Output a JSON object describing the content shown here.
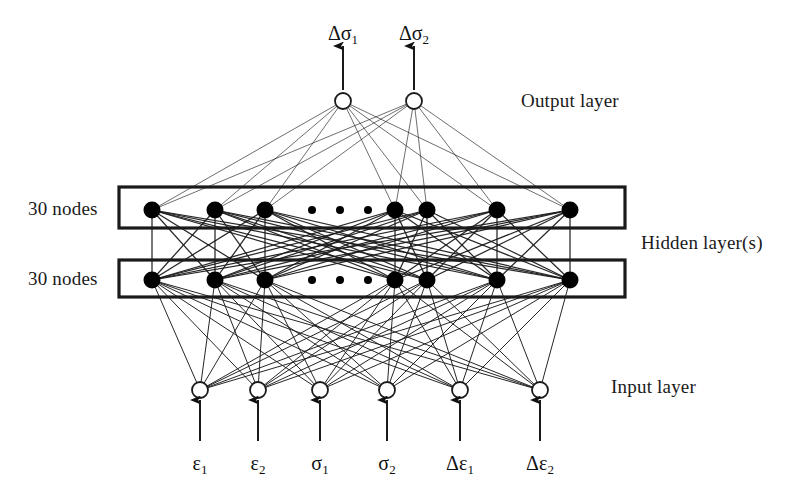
{
  "figure": {
    "type": "neural-network-architecture-diagram",
    "background_color": "#ffffff",
    "line_color": "#1a1a1a",
    "node_fill_hidden": "#000000",
    "node_fill_io": "#ffffff"
  },
  "labels": {
    "output_layer": "Output layer",
    "hidden_layers": "Hidden layer(s)",
    "input_layer": "Input layer",
    "hidden_count_top": "30 nodes",
    "hidden_count_bottom": "30 nodes"
  },
  "outputs": {
    "count": 2,
    "items": [
      {
        "symbol": "Δσ",
        "subscript": "1",
        "x": 343
      },
      {
        "symbol": "Δσ",
        "subscript": "2",
        "x": 414
      }
    ],
    "node_y": 101,
    "label_y": 22,
    "arrow_top_y": 46,
    "arrow_bottom_y": 90
  },
  "inputs": {
    "count": 6,
    "items": [
      {
        "symbol": "ε",
        "subscript": "1",
        "x": 200
      },
      {
        "symbol": "ε",
        "subscript": "2",
        "x": 258
      },
      {
        "symbol": "σ",
        "subscript": "1",
        "x": 320
      },
      {
        "symbol": "σ",
        "subscript": "2",
        "x": 387
      },
      {
        "symbol": "Δε",
        "subscript": "1",
        "x": 460
      },
      {
        "symbol": "Δε",
        "subscript": "2",
        "x": 540
      }
    ],
    "node_y": 390,
    "arrow_top_y": 400,
    "arrow_bottom_y": 441,
    "label_y": 452
  },
  "hidden_layers": [
    {
      "name": "hidden-layer-top",
      "nodes_label": "30 nodes",
      "box": {
        "x": 119,
        "y": 187,
        "width": 506,
        "height": 41
      },
      "node_y": 210,
      "node_x": [
        152,
        215,
        265,
        395,
        427,
        497,
        570
      ],
      "ellipsis_x": [
        312,
        340,
        368
      ]
    },
    {
      "name": "hidden-layer-bottom",
      "nodes_label": "30 nodes",
      "box": {
        "x": 119,
        "y": 260,
        "width": 506,
        "height": 37
      },
      "node_y": 280,
      "node_x": [
        152,
        215,
        265,
        395,
        427,
        497,
        570
      ],
      "ellipsis_x": [
        312,
        340,
        368
      ]
    }
  ],
  "side_labels": {
    "output_layer": {
      "x": 521,
      "y": 90
    },
    "hidden_layers": {
      "x": 641,
      "y": 232
    },
    "input_layer": {
      "x": 611,
      "y": 376
    },
    "nodes_top": {
      "x": 28,
      "y": 198
    },
    "nodes_bottom": {
      "x": 28,
      "y": 268
    }
  }
}
